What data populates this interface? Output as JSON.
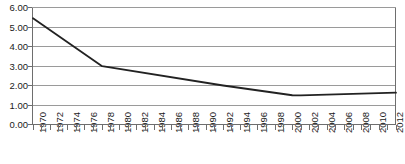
{
  "chart_data": {
    "type": "line",
    "title": "",
    "xlabel": "",
    "ylabel": "",
    "ylim": [
      0.0,
      6.0
    ],
    "ytick_labels": [
      "0.00",
      "1.00",
      "2.00",
      "3.00",
      "4.00",
      "5.00",
      "6.00"
    ],
    "ytick_values": [
      0.0,
      1.0,
      2.0,
      3.0,
      4.0,
      5.0,
      6.0
    ],
    "grid": true,
    "legend": "none",
    "xlim": [
      1970,
      2012
    ],
    "xtick_labels": [
      "1970",
      "1972",
      "1974",
      "1976",
      "1978",
      "1980",
      "1982",
      "1984",
      "1986",
      "1988",
      "1990",
      "1992",
      "1994",
      "1996",
      "1998",
      "2000",
      "2002",
      "2004",
      "2006",
      "2008",
      "2010",
      "2012"
    ],
    "xtick_values": [
      1970,
      1972,
      1974,
      1976,
      1978,
      1980,
      1982,
      1984,
      1986,
      1988,
      1990,
      1992,
      1994,
      1996,
      1998,
      2000,
      2002,
      2004,
      2006,
      2008,
      2010,
      2012
    ],
    "minor_tick_interval": 1,
    "x": [
      1970,
      1978,
      1992,
      2000,
      2001,
      2012
    ],
    "values": [
      5.45,
      2.99,
      2.0,
      1.5,
      1.49,
      1.63
    ],
    "series": [
      {
        "name": "series-1",
        "color": "#222222",
        "x": [
          1970,
          1978,
          1992,
          2000,
          2001,
          2012
        ],
        "values": [
          5.45,
          2.99,
          2.0,
          1.5,
          1.49,
          1.63
        ]
      }
    ],
    "colors": {
      "line": "#222222",
      "grid": "#9a9a9a",
      "axis": "#6e6e6e",
      "text": "#1a1a1a",
      "background": "#ffffff"
    }
  }
}
